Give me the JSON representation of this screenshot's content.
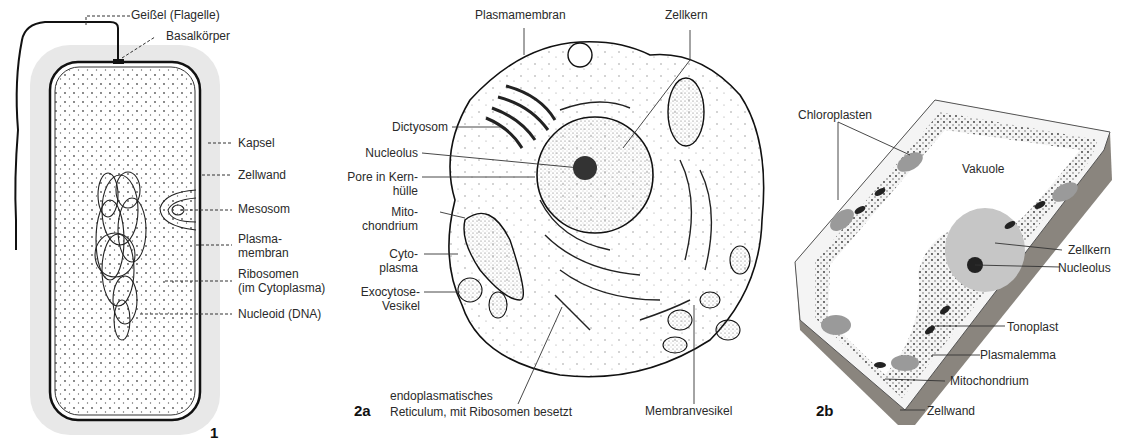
{
  "figures": [
    {
      "id": "1",
      "number_label": "1",
      "subject": "Bakterienzelle",
      "labels": [
        "Geißel (Flagelle)",
        "Basalkörper",
        "Kapsel",
        "Zellwand",
        "Mesosom",
        "Plasma-\nmembran",
        "Ribosomen\n(im Cytoplasma)",
        "Nucleoid (DNA)"
      ]
    },
    {
      "id": "2a",
      "number_label": "2a",
      "subject": "Tierzelle",
      "labels": [
        "Plasmamembran",
        "Zellkern",
        "Dictyosom",
        "Nucleolus",
        "Pore in Kern-\nhülle",
        "Mito-\nchondrium",
        "Cyto-\nplasma",
        "Exocytose-\nVesikel",
        "endoplasmatisches\nReticulum, mit Ribosomen besetzt",
        "Membranvesikel"
      ]
    },
    {
      "id": "2b",
      "number_label": "2b",
      "subject": "Pflanzenzelle",
      "labels": [
        "Chloroplasten",
        "Vakuole",
        "Zellkern",
        "Nucleolus",
        "Tonoplast",
        "Plasmalemma",
        "Mitochondrium",
        "Zellwand"
      ]
    }
  ],
  "colors": {
    "line": "#222222",
    "capsule": "#e6e6e6",
    "stipple": "#555555",
    "wall_2b": "#8a857e"
  }
}
